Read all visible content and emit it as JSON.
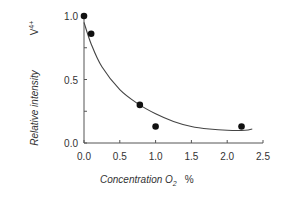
{
  "chart_data": {
    "type": "scatter",
    "title": "",
    "xlabel": "Concentration O2 %",
    "ylabel": "Relative intensity V4+",
    "xlim": [
      0.0,
      2.5
    ],
    "ylim": [
      0.0,
      1.0
    ],
    "x_ticks": [
      "0.0",
      "0.5",
      "1.0",
      "1.5",
      "2.0",
      "2.5"
    ],
    "y_ticks": [
      "0.0",
      "0.5",
      "1.0"
    ],
    "grid": false,
    "legend": null,
    "series": [
      {
        "name": "measured",
        "kind": "scatter",
        "x": [
          0.0,
          0.1,
          0.78,
          1.0,
          2.2
        ],
        "y": [
          1.0,
          0.86,
          0.3,
          0.13,
          0.13
        ]
      },
      {
        "name": "fit",
        "kind": "line",
        "x": [
          0.0,
          0.1,
          0.25,
          0.5,
          0.75,
          1.0,
          1.25,
          1.5,
          1.75,
          2.0,
          2.25,
          2.35
        ],
        "y": [
          0.95,
          0.78,
          0.6,
          0.42,
          0.31,
          0.23,
          0.17,
          0.13,
          0.11,
          0.1,
          0.1,
          0.11
        ]
      }
    ]
  },
  "labels": {
    "y_main": "Relative intensity",
    "y_species": "V",
    "y_species_sup": "4+",
    "x_main": "Concentration O",
    "x_sub": "2",
    "x_unit": "%"
  }
}
